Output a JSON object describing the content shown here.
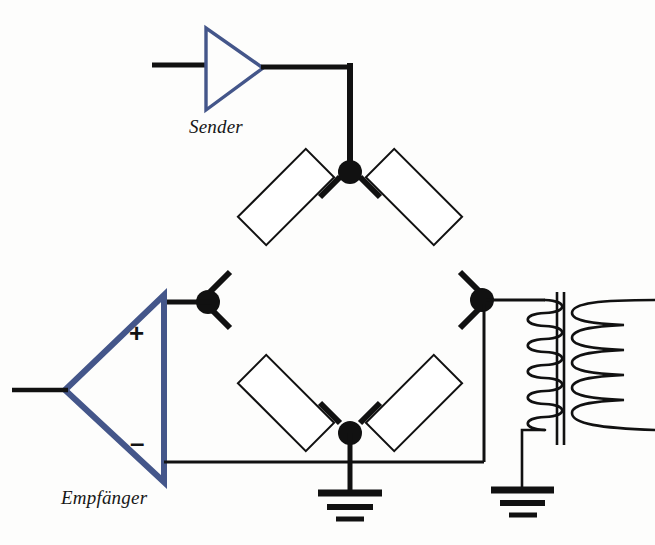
{
  "diagram": {
    "type": "circuit-schematic",
    "background_color": "#fdfdfc",
    "wire_color": "#111111",
    "amplifier_color": "#44568a",
    "labels": {
      "sender": "Sender",
      "receiver": "Empfänger",
      "plus": "+",
      "minus": "–"
    },
    "components": [
      {
        "name": "sender-amplifier",
        "kind": "amplifier-triangle",
        "label": "Sender",
        "orientation": "right",
        "color": "#44568a"
      },
      {
        "name": "receiver-amplifier",
        "kind": "differential-amplifier-triangle",
        "label": "Empfänger",
        "orientation": "left",
        "color": "#44568a",
        "terminals": [
          "+",
          "–"
        ]
      },
      {
        "name": "resistor-top-left",
        "kind": "resistor",
        "position": "bridge-upper-left"
      },
      {
        "name": "resistor-top-right",
        "kind": "resistor",
        "position": "bridge-upper-right"
      },
      {
        "name": "resistor-bottom-left",
        "kind": "resistor",
        "position": "bridge-lower-left"
      },
      {
        "name": "resistor-bottom-right",
        "kind": "resistor",
        "position": "bridge-lower-right"
      },
      {
        "name": "transformer",
        "kind": "transformer",
        "windings": 2,
        "core": "iron-core-double-line"
      },
      {
        "name": "ground-center",
        "kind": "earth-ground",
        "bars": 3
      },
      {
        "name": "ground-right",
        "kind": "earth-ground",
        "bars": 3
      },
      {
        "name": "junction-top",
        "kind": "node-dot"
      },
      {
        "name": "junction-left",
        "kind": "node-dot"
      },
      {
        "name": "junction-right",
        "kind": "node-dot"
      },
      {
        "name": "junction-bottom",
        "kind": "node-dot"
      }
    ]
  }
}
